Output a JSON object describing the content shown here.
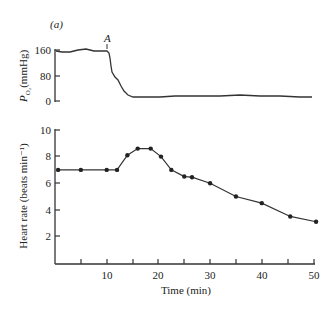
{
  "panel_label": "(a)",
  "annotation": "A",
  "chart_data": [
    {
      "type": "line",
      "title": "",
      "ylabel": "P_O2 (mmHg)",
      "ylabel_parts": {
        "main": "P",
        "sub": "O₂",
        "unit": "(mmHg)"
      },
      "xlabel": "",
      "ylim": [
        0,
        160
      ],
      "yticks": [
        0,
        80,
        160
      ],
      "xlim": [
        0,
        50
      ],
      "annotations": [
        {
          "text": "A",
          "x": 10
        }
      ],
      "x": [
        0,
        2,
        5,
        8,
        10,
        10.5,
        11,
        11.5,
        12,
        13,
        14,
        15,
        20,
        25,
        30,
        35,
        40,
        45,
        50
      ],
      "values": [
        150,
        148,
        155,
        152,
        152,
        140,
        90,
        70,
        55,
        35,
        20,
        14,
        14,
        15,
        16,
        17,
        16,
        15,
        14
      ]
    },
    {
      "type": "line",
      "title": "",
      "ylabel": "Heart rate (beats min⁻¹)",
      "xlabel": "Time (min)",
      "ylim": [
        0,
        10
      ],
      "yticks": [
        2,
        4,
        6,
        8,
        10
      ],
      "xlim": [
        0,
        50
      ],
      "xticks": [
        5,
        10,
        15,
        20,
        25,
        30,
        35,
        40,
        45,
        50
      ],
      "xtick_labels": [
        "10",
        "20",
        "30",
        "40",
        "50"
      ],
      "x": [
        0.6,
        5,
        10,
        12,
        14,
        16,
        18.5,
        20.5,
        22.5,
        25,
        26.5,
        30,
        35,
        40,
        45.5,
        50.5
      ],
      "values": [
        7.0,
        7.0,
        7.0,
        7.0,
        8.1,
        8.6,
        8.6,
        8.0,
        7.0,
        6.5,
        6.45,
        6.0,
        5.0,
        4.5,
        3.5,
        3.1
      ],
      "marker": "dot"
    }
  ],
  "labels": {
    "po2_tick_160": "160",
    "po2_tick_80": "80",
    "po2_tick_0": "0",
    "hr_tick_10": "10",
    "hr_tick_8": "8",
    "hr_tick_6": "6",
    "hr_tick_4": "4",
    "hr_tick_2": "2",
    "x_tick_10": "10",
    "x_tick_20": "20",
    "x_tick_30": "30",
    "x_tick_40": "40",
    "x_tick_50": "50",
    "po2_label_main": "P",
    "po2_label_sub": "O₂",
    "po2_label_unit": "(mmHg)",
    "hr_label": "Heart rate (beats min⁻¹)",
    "x_label": "Time (min)"
  }
}
